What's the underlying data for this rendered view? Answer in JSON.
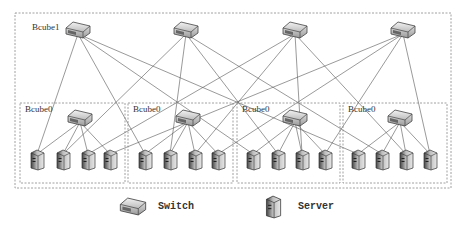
{
  "diagram": {
    "type": "BCube topology",
    "level1_label": "Bcube1",
    "level0_label": "Bcube0",
    "level1_switches": [
      {
        "id": "s1-0",
        "x": 78,
        "y": 30
      },
      {
        "id": "s1-1",
        "x": 186,
        "y": 30
      },
      {
        "id": "s1-2",
        "x": 295,
        "y": 30
      },
      {
        "id": "s1-3",
        "x": 403,
        "y": 30
      }
    ],
    "bcube0_groups": [
      {
        "label": "Bcube0",
        "box": [
          20,
          103,
          105,
          80
        ],
        "switch": [
          80,
          118
        ],
        "servers": [
          37,
          63,
          88,
          110
        ]
      },
      {
        "label": "Bcube0",
        "box": [
          128,
          103,
          105,
          80
        ],
        "switch": [
          188,
          118
        ],
        "servers": [
          145,
          170,
          195,
          218
        ]
      },
      {
        "label": "Bcube0",
        "box": [
          237,
          103,
          103,
          80
        ],
        "switch": [
          295,
          118
        ],
        "servers": [
          253,
          278,
          302,
          325
        ]
      },
      {
        "label": "Bcube0",
        "box": [
          343,
          103,
          104,
          80
        ],
        "switch": [
          400,
          118
        ],
        "servers": [
          358,
          382,
          406,
          430
        ]
      }
    ],
    "server_y": 160,
    "outer_box": [
      15,
      13,
      436,
      175
    ],
    "colors": {
      "line": "#555555",
      "dash": "#888888",
      "icon_fill": "#d8d8d8",
      "icon_dark": "#555555"
    }
  },
  "legend": {
    "items": [
      {
        "icon": "switch-icon",
        "label": "Switch"
      },
      {
        "icon": "server-icon",
        "label": "Server"
      }
    ]
  }
}
